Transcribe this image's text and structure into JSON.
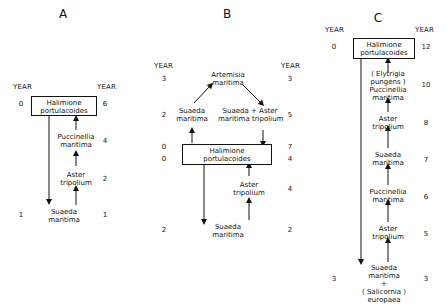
{
  "panels": [
    {
      "id": "A",
      "title": "A",
      "year_header_left": "YEAR",
      "year_header_right": "YEAR",
      "box": {
        "line1": "Halimione",
        "line2": "portulacoides"
      },
      "box_year_left": "0",
      "box_year_right": "6",
      "stages": [
        {
          "line1": "Puccinellia",
          "line2": "maritima",
          "year_right": "4"
        },
        {
          "line1": "Aster",
          "line2": "tripolium",
          "year_right": "2"
        }
      ],
      "bottom": {
        "line1": "Suaeda",
        "line2": "maritima",
        "year_left": "1",
        "year_right": "1"
      }
    },
    {
      "id": "B",
      "title": "B",
      "year_header_left": "YEAR",
      "year_header_right": "YEAR",
      "top": {
        "line1": "Artemisia",
        "line2": "maritima",
        "year_left": "3",
        "year_right": "3"
      },
      "left_node": {
        "line1": "Suaeda",
        "line2": "maritima",
        "year_left": "2"
      },
      "right_node": {
        "line1a": "Suaeda",
        "plus": "+",
        "line1b": "Aster",
        "line2a": "maritima",
        "line2b": "tripolium",
        "year_right": "5"
      },
      "box": {
        "line1": "Halimione",
        "line2": "portulacoides"
      },
      "box_year_left_top": "0",
      "box_year_left_bottom": "0",
      "box_year_right_top": "7",
      "box_year_right_bottom": "4",
      "stages": [
        {
          "line1": "Aster",
          "line2": "tripolium",
          "year_right": "4"
        }
      ],
      "bottom": {
        "line1": "Suaeda",
        "line2": "maritima",
        "year_left": "2",
        "year_right": "2"
      }
    },
    {
      "id": "C",
      "title": "C",
      "year_header_left": "YEAR",
      "year_header_right": "YEAR",
      "box": {
        "line1": "Halimione",
        "line2": "portulacoides"
      },
      "box_year_left": "0",
      "box_year_right": "12",
      "stages": [
        {
          "line1": "( Elytrigia",
          "line2": "pungens )",
          "line3": "Puccinellia",
          "line4": "maritima",
          "year_right": "10"
        },
        {
          "line1": "Aster",
          "line2": "tripolium",
          "year_right": "8"
        },
        {
          "line1": "Suaeda",
          "line2": "maritima",
          "year_right": "7"
        },
        {
          "line1": "Puccinellia",
          "line2": "maritima",
          "year_right": "6"
        },
        {
          "line1": "Aster",
          "line2": "tripolium",
          "year_right": "5"
        }
      ],
      "bottom": {
        "line1": "Suaeda",
        "line2": "maritima",
        "plus": "+",
        "line3": "( Salicornia )",
        "line4": "europaea",
        "year_left": "3",
        "year_right": "3"
      }
    }
  ],
  "colors": {
    "ink": "#111111",
    "background": "#ffffff"
  }
}
